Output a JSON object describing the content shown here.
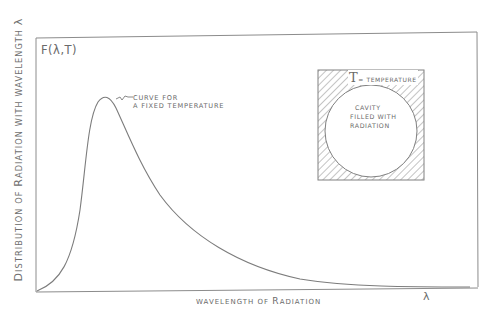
{
  "diagram": {
    "y_axis_label": {
      "first_letter": "D",
      "rest": "ISTRIBUTION OF ",
      "r": "R",
      "rest2": "ADIATION WITH WAVELENGTH ",
      "symbol": "λ"
    },
    "function_label": "F(λ,T)",
    "curve_annotation": {
      "line1": "CURVE FOR",
      "line2": "A FIXED TEMPERATURE"
    },
    "x_axis_label": {
      "part1": "WAVELENGTH OF ",
      "r": "R",
      "part2": "ADIATION"
    },
    "x_axis_symbol": "λ",
    "inset": {
      "temp_symbol": "T",
      "temp_text": "= TEMPERATURE",
      "cavity_lines": [
        "CAVITY",
        "FILLED WITH",
        "RADIATION"
      ]
    }
  },
  "style": {
    "ink": "#7a7a7a",
    "background": "#ffffff"
  }
}
